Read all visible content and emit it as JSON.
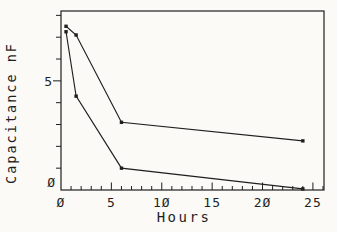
{
  "figure": {
    "background": "#fbfaf7",
    "ink": "#1f1f1f"
  },
  "chart_data": {
    "type": "line",
    "title": "",
    "xlabel": "Hours",
    "ylabel": "Capacitance nF",
    "xlim": [
      0,
      26.1
    ],
    "ylim": [
      0,
      8.2
    ],
    "x_major_ticks": [
      0,
      5,
      10,
      15,
      20,
      25
    ],
    "x_minor_tick_step": 1,
    "y_labeled_ticks": [
      0,
      5
    ],
    "y_major_ticks": [
      5
    ],
    "y_minor_tick_step": 1,
    "grid": "off",
    "legend": "none",
    "marker_style": "filled-square",
    "zero_glyph_style": "slashed-plotter-zero",
    "series": [
      {
        "name": "upper-curve",
        "x": [
          0.5,
          1.5,
          6,
          24
        ],
        "y": [
          7.5,
          7.1,
          3.1,
          2.25
        ]
      },
      {
        "name": "lower-curve",
        "x": [
          0.5,
          1.5,
          6,
          24
        ],
        "y": [
          7.25,
          4.3,
          1.0,
          0.05
        ]
      }
    ]
  }
}
